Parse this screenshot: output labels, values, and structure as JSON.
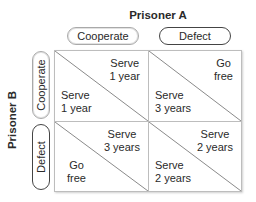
{
  "title_a": "Prisoner A",
  "title_b": "Prisoner B",
  "columns": [
    {
      "label": "Cooperate",
      "style": "light"
    },
    {
      "label": "Defect",
      "style": "dark"
    }
  ],
  "rows": [
    {
      "label": "Cooperate",
      "style": "light"
    },
    {
      "label": "Defect",
      "style": "dark"
    }
  ],
  "cells": [
    [
      {
        "a": [
          "Serve",
          "1 year"
        ],
        "b": [
          "Serve",
          "1 year"
        ]
      },
      {
        "a": [
          "Go",
          "free"
        ],
        "b": [
          "Serve",
          "3 years"
        ]
      }
    ],
    [
      {
        "a": [
          "Serve",
          "3 years"
        ],
        "b": [
          "Go",
          "free"
        ]
      },
      {
        "a": [
          "Serve",
          "2 years"
        ],
        "b": [
          "Serve",
          "2 years"
        ]
      }
    ]
  ],
  "colors": {
    "grid_line": "#bdbdbd",
    "text": "#2a2a2a",
    "pill_light_border": "#a9a9a9",
    "pill_dark_border": "#444444"
  }
}
